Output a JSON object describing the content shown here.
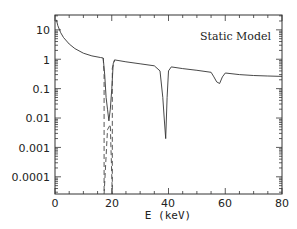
{
  "chart_data": {
    "type": "line",
    "title": "Static Model",
    "xlabel": "E (keV)",
    "ylabel": "",
    "xlim": [
      0,
      80
    ],
    "ylim": [
      2.6e-05,
      32
    ],
    "yscale": "log",
    "grid": false,
    "legend": null,
    "x_ticks": [
      "0",
      "20",
      "40",
      "60",
      "80"
    ],
    "y_ticks": [
      "10",
      "1",
      "0.1",
      "0.01",
      "0.001",
      "0.0001"
    ],
    "annotations": [
      "Static Model"
    ],
    "series": [
      {
        "name": "spectrum (solid)",
        "style": "solid",
        "x": [
          0.5,
          1,
          2,
          3,
          5,
          7,
          10,
          13,
          16,
          17,
          17.5,
          18,
          18.5,
          19,
          19.5,
          20,
          20.5,
          21,
          25,
          30,
          35,
          37,
          38,
          38.5,
          39,
          39.5,
          40,
          41,
          45,
          50,
          55,
          56,
          57,
          58,
          59,
          60,
          65,
          70,
          75,
          80
        ],
        "values": [
          22,
          14,
          8,
          5.5,
          3.3,
          2.3,
          1.6,
          1.3,
          1.15,
          1.1,
          0.3,
          0.05,
          0.02,
          0.008,
          0.02,
          0.1,
          0.7,
          0.95,
          0.82,
          0.7,
          0.6,
          0.4,
          0.05,
          0.01,
          0.002,
          0.05,
          0.4,
          0.55,
          0.48,
          0.42,
          0.36,
          0.25,
          0.17,
          0.15,
          0.25,
          0.34,
          0.3,
          0.28,
          0.27,
          0.26
        ]
      },
      {
        "name": "spectrum (dashed)",
        "style": "dashed",
        "x": [
          17,
          17.3,
          17.3,
          18.5,
          19.5,
          20.2,
          20.2,
          21
        ],
        "values": [
          1.1,
          0.3,
          2.6e-05,
          0.004,
          0.006,
          2.6e-05,
          0.5,
          0.95
        ]
      }
    ]
  },
  "labels": {
    "title": "Static Model",
    "xlabel": "E (keV)",
    "xticks": [
      "0",
      "20",
      "40",
      "60",
      "80"
    ],
    "yticks": [
      "10",
      "1",
      "0.1",
      "0.01",
      "0.001",
      "0.0001"
    ]
  }
}
